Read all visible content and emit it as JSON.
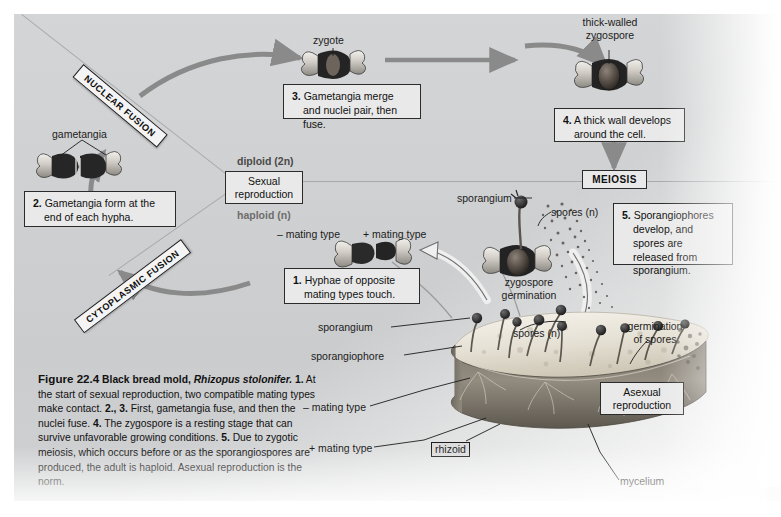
{
  "figure": {
    "number": "Figure 22.4",
    "title": "Black bread mold, ",
    "species": "Rhizopus stolonifer.",
    "caption_parts": [
      {
        "bold": "1.",
        "text": " At the start of sexual reproduction, two compatible mating types make contact. "
      },
      {
        "bold": "2., 3.",
        "text": " First, gametangia fuse, and then the nuclei fuse. "
      },
      {
        "bold": "4.",
        "text": " The zygospore is a resting stage that can survive unfavorable growing conditions. "
      },
      {
        "bold": "5.",
        "text": " Due to zygotic meiosis, which occurs before or as the sporangiospores are produced, the adult is haploid. Asexual reproduction is the norm."
      }
    ]
  },
  "steps": [
    {
      "num": "1.",
      "text": "Hyphae of opposite mating types touch."
    },
    {
      "num": "2.",
      "text": "Gametangia form at the end of each hypha."
    },
    {
      "num": "3.",
      "text": "Gametangia merge and nuclei pair, then fuse."
    },
    {
      "num": "4.",
      "text": "A thick wall develops around the cell."
    },
    {
      "num": "5.",
      "text": "Sporangiophores develop, and spores are released from sporangium."
    }
  ],
  "banners": [
    {
      "label": "NUCLEAR FUSION"
    },
    {
      "label": "CYTOPLASMIC FUSION"
    }
  ],
  "process_boxes": {
    "sexual": "Sexual reproduction",
    "meiosis": "MEIOSIS",
    "asexual": "Asexual reproduction"
  },
  "ploidy": {
    "diploid": "diploid (2n)",
    "haploid": "haploid (n)"
  },
  "labels": {
    "zygote": "zygote",
    "thick_walled_zygospore": "thick-walled\nzygospore",
    "thick_walled_line1": "thick-walled",
    "thick_walled_line2": "zygospore",
    "gametangia": "gametangia",
    "minus_mating_type_top": "– mating type",
    "plus_mating_type_top": "+ mating type",
    "sporangium_upper": "sporangium",
    "spores_n_upper": "spores (n)",
    "zygospore_germination_line1": "zygospore",
    "zygospore_germination_line2": "germination",
    "germination_of_spores_line1": "germination",
    "germination_of_spores_line2": "of spores",
    "spores_n_lower": "spores (n)",
    "sporangium_lower": "sporangium",
    "sporangiophore": "sporangiophore",
    "minus_mating_type_lower": "– mating type",
    "plus_mating_type_lower": "+ mating type",
    "rhizoid": "rhizoid",
    "mycelium": "mycelium"
  },
  "colors": {
    "panel_bg": "#d2d3d4",
    "box_bg": "#e9e9e9",
    "box_border": "#2b2b2b",
    "arrow_gray": "#8a8a8a",
    "banner_bg": "#f4f4f4",
    "text": "#111111",
    "bread_light": "#efece4",
    "bread_crust": "#6f6a62"
  }
}
